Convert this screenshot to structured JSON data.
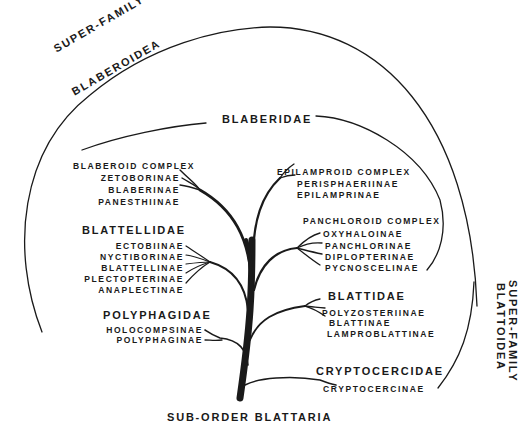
{
  "diagram": {
    "title": "SUB-ORDER BLATTARIA",
    "superfamilies": [
      {
        "line1": "SUPER-FAMILY",
        "line2": "BLABEROIDEA"
      },
      {
        "line1": "SUPER-FAMILY",
        "line2": "BLATTOIDEA"
      }
    ],
    "families": {
      "blaberidae": {
        "name": "BLABERIDAE",
        "complexes": [
          {
            "name": "BLABEROID COMPLEX",
            "subfamilies": [
              "ZETOBORINAE",
              "BLABERINAE",
              "PANESTHIINAE"
            ]
          },
          {
            "name": "EPILAMPROID COMPLEX",
            "subfamilies": [
              "PERISPHAERIINAE",
              "EPILAMPRINAE"
            ]
          },
          {
            "name": "PANCHLOROID COMPLEX",
            "subfamilies": [
              "OXYHALOINAE",
              "PANCHLORINAE",
              "DIPLOPTERINAE",
              "PYCNOSCELINAE"
            ]
          }
        ]
      },
      "blattellidae": {
        "name": "BLATTELLIDAE",
        "subfamilies": [
          "ECTOBIINAE",
          "NYCTIBORINAE",
          "BLATTELLINAE",
          "PLECTOPTERINAE",
          "ANAPLECTINAE"
        ]
      },
      "polyphagidae": {
        "name": "POLYPHAGIDAE",
        "subfamilies": [
          "HOLOCOMPSINAE",
          "POLYPHAGINAE"
        ]
      },
      "blattidae": {
        "name": "BLATTIDAE",
        "subfamilies": [
          "POLYZOSTERIINAE",
          "BLATTINAE",
          "LAMPROBLATTINAE"
        ]
      },
      "cryptocercidae": {
        "name": "CRYPTOCERCIDAE",
        "subfamilies": [
          "CRYPTOCERCINAE"
        ]
      }
    },
    "line_color": "#1a1a1a"
  }
}
